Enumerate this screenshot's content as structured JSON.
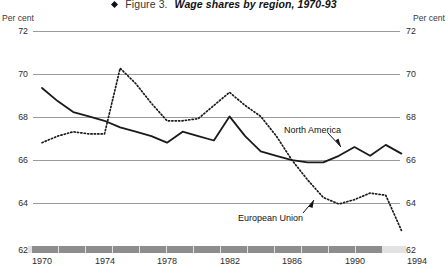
{
  "figure": {
    "bullet_icon": "diamond-bullet-icon",
    "label": "Figure 3.",
    "title": "Wage shares by region, 1970-93"
  },
  "axes": {
    "unit_left": "Per cent",
    "unit_right": "Per cent",
    "y_ticks": [
      "72",
      "70",
      "68",
      "66",
      "64",
      "62"
    ],
    "x_ticks": [
      "1970",
      "1974",
      "1978",
      "1982",
      "1986",
      "1990",
      "1994"
    ]
  },
  "annotations": {
    "north_america": "North America",
    "european_union": "European Union"
  },
  "colors": {
    "gridline": "#9b9b9b",
    "axis_bar_base": "#e2e2e2",
    "axis_bar_dash": "#8d8d8d",
    "series_line": "#1a1a1a",
    "background": "#ffffff"
  },
  "chart_data": {
    "type": "line",
    "title": "Wage shares by region, 1970-93",
    "xlabel": "",
    "ylabel": "Per cent",
    "ylim": [
      62,
      72
    ],
    "xlim": [
      1970,
      1994
    ],
    "grid": true,
    "legend": "inline-annotations",
    "x": [
      1970,
      1971,
      1972,
      1973,
      1974,
      1975,
      1976,
      1977,
      1978,
      1979,
      1980,
      1981,
      1982,
      1983,
      1984,
      1985,
      1986,
      1987,
      1988,
      1989,
      1990,
      1991,
      1992,
      1993
    ],
    "series": [
      {
        "name": "North America",
        "style": "solid",
        "values": [
          69.4,
          68.8,
          68.3,
          68.1,
          67.9,
          67.6,
          67.4,
          67.2,
          66.9,
          67.4,
          67.2,
          67.0,
          68.1,
          67.2,
          66.5,
          66.3,
          66.1,
          66.0,
          66.0,
          66.3,
          66.7,
          66.3,
          66.8,
          66.4
        ]
      },
      {
        "name": "European Union",
        "style": "dotted",
        "values": [
          66.9,
          67.2,
          67.4,
          67.3,
          67.3,
          70.3,
          69.6,
          68.7,
          67.9,
          67.9,
          68.0,
          68.6,
          69.2,
          68.6,
          68.1,
          67.2,
          66.1,
          65.2,
          64.4,
          64.1,
          64.3,
          64.6,
          64.5,
          62.9
        ]
      }
    ]
  }
}
